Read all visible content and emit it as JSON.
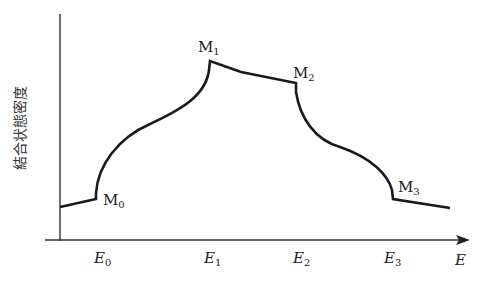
{
  "figure": {
    "y_axis_label": "結合状態密度",
    "x_axis_label": "E",
    "points": [
      {
        "name": "M",
        "sub": "0"
      },
      {
        "name": "M",
        "sub": "1"
      },
      {
        "name": "M",
        "sub": "2"
      },
      {
        "name": "M",
        "sub": "3"
      }
    ],
    "x_ticks": [
      {
        "name": "E",
        "sub": "0"
      },
      {
        "name": "E",
        "sub": "1"
      },
      {
        "name": "E",
        "sub": "2"
      },
      {
        "name": "E",
        "sub": "3"
      }
    ]
  },
  "colors": {
    "curve": "#1a1a1a",
    "axis": "#333333",
    "background": "#ffffff"
  }
}
